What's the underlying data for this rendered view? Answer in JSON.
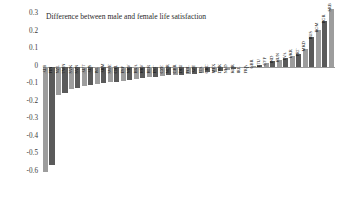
{
  "chart_data": {
    "type": "bar",
    "title": "Difference between male and female life satisfaction",
    "xlabel": "",
    "ylabel": "",
    "ylim": [
      -0.6,
      0.3
    ],
    "ytick_step": 0.1,
    "yticks": [
      "0.3",
      "0.2",
      "0.1",
      "0",
      "-0.1",
      "-0.2",
      "-0.3",
      "-0.4",
      "-0.5",
      "-0.6"
    ],
    "grid": false,
    "legend": "none",
    "bar_colors": [
      "#9d9d9d",
      "#5a5a5a"
    ],
    "color_pattern": "alternating light and dark gray",
    "categories": [
      "ALB",
      "FIN",
      "NZL",
      "TWN",
      "SVK",
      "SVN",
      "AUT",
      "AUS",
      "ISL",
      "ARM",
      "SWE",
      "CHL",
      "ESP",
      "NRV",
      "BRA",
      "HRV",
      "BLR",
      "EST",
      "CZE",
      "NOR",
      "GBR",
      "DEU",
      "POL",
      "AZE",
      "ITA",
      "GRC",
      "MEX",
      "DNK",
      "NLD",
      "KOR",
      "IRL",
      "FRA",
      "GBR2",
      "LTU",
      "CYP",
      "IND",
      "HUN",
      "LVA",
      "UKR",
      "PRT",
      "MKD",
      "RUS",
      "ROM",
      "BGR",
      "SRB"
    ],
    "values": [
      -0.6,
      -0.56,
      -0.16,
      -0.15,
      -0.13,
      -0.12,
      -0.11,
      -0.105,
      -0.1,
      -0.095,
      -0.09,
      -0.085,
      -0.08,
      -0.075,
      -0.07,
      -0.065,
      -0.06,
      -0.058,
      -0.055,
      -0.05,
      -0.048,
      -0.045,
      -0.042,
      -0.04,
      -0.035,
      -0.03,
      -0.028,
      -0.025,
      -0.02,
      -0.015,
      -0.01,
      -0.005,
      0.005,
      0.01,
      0.02,
      0.03,
      0.04,
      0.05,
      0.06,
      0.075,
      0.1,
      0.17,
      0.21,
      0.26,
      0.33
    ]
  }
}
